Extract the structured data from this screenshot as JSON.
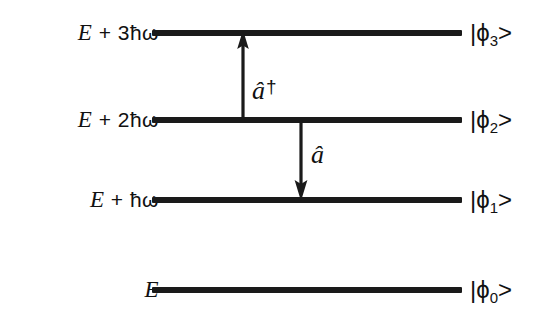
{
  "diagram": {
    "background_color": "#ffffff",
    "line_color": "#1a1a1a",
    "levels": [
      {
        "energy_label_prefix": "E",
        "energy_label_rest": " + 3ħω",
        "energy_label_full": "E + 3ħω",
        "ket_open": "|ϕ",
        "ket_index": "3",
        "ket_close": ">",
        "ket_full": "|ϕ₃>",
        "quantum_number": 3,
        "y": 33
      },
      {
        "energy_label_prefix": "E",
        "energy_label_rest": " + 2ħω",
        "energy_label_full": "E + 2ħω",
        "ket_open": "|ϕ",
        "ket_index": "2",
        "ket_close": ">",
        "ket_full": "|ϕ₂>",
        "quantum_number": 2,
        "y": 120
      },
      {
        "energy_label_prefix": "E",
        "energy_label_rest": " + ħω",
        "energy_label_full": "E + ħω",
        "ket_open": "|ϕ",
        "ket_index": "1",
        "ket_close": ">",
        "ket_full": "|ϕ₁>",
        "quantum_number": 1,
        "y": 200
      },
      {
        "energy_label_prefix": "E",
        "energy_label_rest": "",
        "energy_label_full": "E",
        "ket_open": "|ϕ",
        "ket_index": "0",
        "ket_close": ">",
        "ket_full": "|ϕ₀>",
        "quantum_number": 0,
        "y": 290
      }
    ],
    "operators": {
      "raising": {
        "symbol": "â",
        "dagger": "†",
        "full": "â†",
        "direction": "up",
        "from_level": 2,
        "to_level": 3
      },
      "lowering": {
        "symbol": "â",
        "dagger": "",
        "full": "â",
        "direction": "down",
        "from_level": 2,
        "to_level": 1
      }
    }
  }
}
